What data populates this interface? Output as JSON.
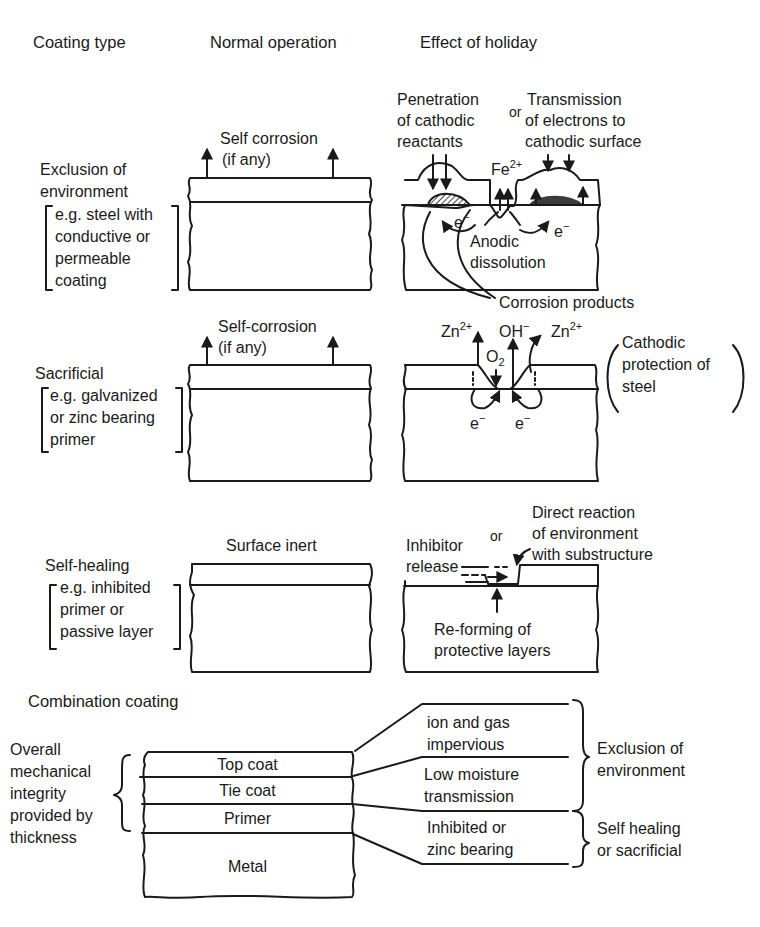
{
  "headers": {
    "coating_type": "Coating type",
    "normal_operation": "Normal operation",
    "effect_of_holiday": "Effect of holiday"
  },
  "rows": [
    {
      "id": "exclusion",
      "title_line1": "Exclusion of",
      "title_line2": "environment",
      "example_lines": [
        "e.g. steel with",
        "conductive or",
        "permeable",
        "coating"
      ],
      "normal_label_line1": "Self corrosion",
      "normal_label_line2": "(if any)",
      "holiday": {
        "penetration_lines": [
          "Penetration",
          "of cathodic",
          "reactants"
        ],
        "or_label": "or",
        "transmission_lines": [
          "Transmission",
          "of electrons to",
          "cathodic surface"
        ],
        "fe_ion": "Fe",
        "fe_charge": "2+",
        "electron_left": "e",
        "electron_right": "e",
        "electron_charge": "−",
        "anodic_line1": "Anodic",
        "anodic_line2": "dissolution",
        "corrosion_products": "Corrosion products"
      }
    },
    {
      "id": "sacrificial",
      "title_line1": "Sacrificial",
      "example_lines": [
        "e.g. galvanized",
        "or zinc bearing",
        "primer"
      ],
      "normal_label_line1": "Self-corrosion",
      "normal_label_line2": "(if any)",
      "holiday": {
        "zn_left": "Zn",
        "zn_charge": "2+",
        "oh": "OH",
        "oh_charge": "−",
        "zn_right": "Zn",
        "o2": "O",
        "o2_sub": "2",
        "electron_left": "e",
        "electron_right": "e",
        "electron_charge": "−",
        "note_lines": [
          "Cathodic",
          "protection of",
          "steel"
        ]
      }
    },
    {
      "id": "self_healing",
      "title_line1": "Self-healing",
      "example_lines": [
        "e.g. inhibited",
        "primer or",
        "passive layer"
      ],
      "normal_label_line1": "Surface inert",
      "holiday": {
        "inhibitor_line1": "Inhibitor",
        "inhibitor_line2": "release",
        "or_label": "or",
        "direct_lines": [
          "Direct reaction",
          "of environment",
          "with substructure"
        ],
        "reforming_line1": "Re-forming of",
        "reforming_line2": "protective layers"
      }
    }
  ],
  "combination": {
    "title": "Combination coating",
    "left_note_lines": [
      "Overall",
      "mechanical",
      "integrity",
      "provided by",
      "thickness"
    ],
    "layers": [
      "Top coat",
      "Tie coat",
      "Primer",
      "Metal"
    ],
    "properties": [
      [
        "ion and gas",
        "impervious"
      ],
      [
        "Low moisture",
        "transmission"
      ],
      [
        "Inhibited or",
        "zinc bearing"
      ]
    ],
    "groups": [
      [
        "Exclusion of",
        "environment"
      ],
      [
        "Self healing",
        "or sacrificial"
      ]
    ]
  },
  "colors": {
    "ink": "#1a1a1a",
    "background": "#ffffff"
  }
}
